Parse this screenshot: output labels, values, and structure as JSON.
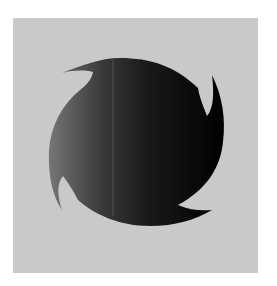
{
  "image": {
    "description": "Dark four-pointed swirl (shuriken-like) shape on a light gray square",
    "colors": {
      "background": "#ffffff",
      "panel": "#c9c9c9",
      "shape_left": "#6e6e6e",
      "shape_mid": "#2e2e2e",
      "shape_right": "#050505",
      "highlight_line": "#5a5a5a"
    }
  }
}
